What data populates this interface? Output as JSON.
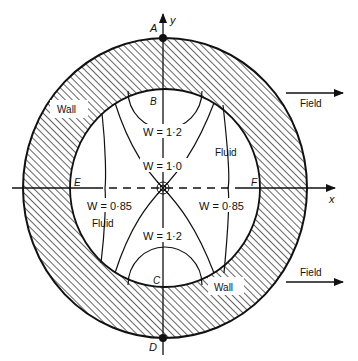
{
  "diagram": {
    "points": {
      "A": "A",
      "B": "B",
      "C": "C",
      "D": "D",
      "E": "E",
      "F": "F"
    },
    "axes": {
      "x": "x",
      "y": "y"
    },
    "regions": {
      "wall_top": "Wall",
      "wall_bottom": "Wall",
      "fluid_right": "Fluid",
      "fluid_left": "Fluid"
    },
    "arrows": {
      "field_top": "Field",
      "field_bottom": "Field"
    },
    "contours": {
      "top": "W = 1·2",
      "middle": "W = 1·0",
      "bottom": "W = 1·2",
      "left": "W = 0·85",
      "right": "W = 0·85"
    },
    "colors": {
      "ink": "#111111",
      "background": "#ffffff"
    }
  }
}
